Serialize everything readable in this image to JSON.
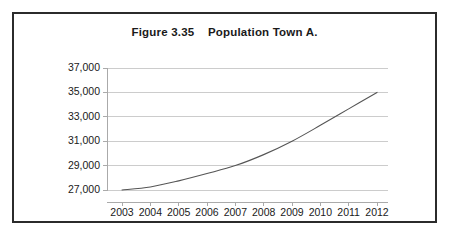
{
  "figure": {
    "title": "Figure 3.35    Population Town A."
  },
  "chart_data": {
    "type": "line",
    "title": "Figure 3.35    Population Town A.",
    "xlabel": "",
    "ylabel": "",
    "categories": [
      "2003",
      "2004",
      "2005",
      "2006",
      "2007",
      "2008",
      "2009",
      "2010",
      "2011",
      "2012"
    ],
    "x": [
      2003,
      2004,
      2005,
      2006,
      2007,
      2008,
      2009,
      2010,
      2011,
      2012
    ],
    "values": [
      27000,
      27250,
      27750,
      28350,
      29000,
      29900,
      31000,
      32300,
      33650,
      35000
    ],
    "series": [
      {
        "name": "Population Town A",
        "values": [
          27000,
          27250,
          27750,
          28350,
          29000,
          29900,
          31000,
          32300,
          33650,
          35000
        ]
      }
    ],
    "ylim": [
      27000,
      37000
    ],
    "ytick_values": [
      27000,
      29000,
      31000,
      33000,
      35000,
      37000
    ],
    "ytick_labels": [
      "27,000",
      "29,000",
      "31,000",
      "33,000",
      "35,000",
      "37,000"
    ],
    "xtick_labels": [
      "2003",
      "2004",
      "2005",
      "2006",
      "2007",
      "2008",
      "2009",
      "2010",
      "2011",
      "2012"
    ],
    "grid": true,
    "grid_axis": "y",
    "legend": false,
    "legend_position": "none",
    "line_color": "#555555",
    "grid_color": "#cccccc",
    "axis_color": "#aaaaaa",
    "background_color": "#ffffff",
    "border_color": "#2b2b2b"
  }
}
